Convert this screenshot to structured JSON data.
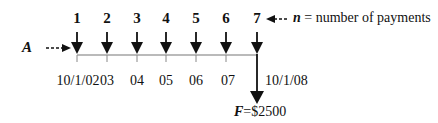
{
  "diagram": {
    "type": "cash-flow-timeline",
    "periods": [
      {
        "n": "1",
        "date": "10/1/02"
      },
      {
        "n": "2",
        "date": "03"
      },
      {
        "n": "3",
        "date": "04"
      },
      {
        "n": "4",
        "date": "05"
      },
      {
        "n": "5",
        "date": "06"
      },
      {
        "n": "6",
        "date": "07"
      },
      {
        "n": "7",
        "date": "10/1/08"
      }
    ],
    "payment_label": "A",
    "n_annotation": {
      "var": "n",
      "text": " = number of payments"
    },
    "future_value": {
      "var": "F",
      "text": "=$2500"
    }
  }
}
